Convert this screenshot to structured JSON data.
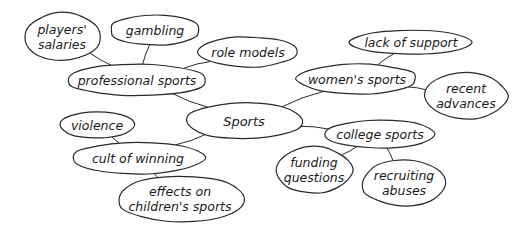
{
  "diagram": {
    "type": "mind-map",
    "center": {
      "id": "sports",
      "text": "Sports"
    },
    "nodes": [
      {
        "id": "sports",
        "lines": [
          "Sports"
        ],
        "cx": 244,
        "cy": 121,
        "rx": 58,
        "ry": 18
      },
      {
        "id": "professional",
        "lines": [
          "professional sports"
        ],
        "cx": 137,
        "cy": 80,
        "rx": 70,
        "ry": 16
      },
      {
        "id": "salaries",
        "lines": [
          "players'",
          "salaries"
        ],
        "cx": 62,
        "cy": 37,
        "rx": 38,
        "ry": 24
      },
      {
        "id": "gambling",
        "lines": [
          "gambling"
        ],
        "cx": 155,
        "cy": 30,
        "rx": 45,
        "ry": 15
      },
      {
        "id": "role-models",
        "lines": [
          "role models"
        ],
        "cx": 248,
        "cy": 52,
        "rx": 49,
        "ry": 15
      },
      {
        "id": "womens",
        "lines": [
          "women's sports"
        ],
        "cx": 357,
        "cy": 79,
        "rx": 60,
        "ry": 15
      },
      {
        "id": "lack-support",
        "lines": [
          "lack of support"
        ],
        "cx": 411,
        "cy": 42,
        "rx": 61,
        "ry": 12
      },
      {
        "id": "recent-advances",
        "lines": [
          "recent",
          "advances"
        ],
        "cx": 466,
        "cy": 96,
        "rx": 41,
        "ry": 23
      },
      {
        "id": "college",
        "lines": [
          "college sports"
        ],
        "cx": 380,
        "cy": 134,
        "rx": 55,
        "ry": 14
      },
      {
        "id": "funding",
        "lines": [
          "funding",
          "questions"
        ],
        "cx": 314,
        "cy": 170,
        "rx": 38,
        "ry": 23
      },
      {
        "id": "recruiting",
        "lines": [
          "recruiting",
          "abuses"
        ],
        "cx": 404,
        "cy": 183,
        "rx": 42,
        "ry": 23
      },
      {
        "id": "cult",
        "lines": [
          "cult of winning"
        ],
        "cx": 138,
        "cy": 158,
        "rx": 66,
        "ry": 16
      },
      {
        "id": "violence",
        "lines": [
          "violence"
        ],
        "cx": 97,
        "cy": 125,
        "rx": 38,
        "ry": 13
      },
      {
        "id": "childrens",
        "lines": [
          "effects on",
          "children's sports"
        ],
        "cx": 180,
        "cy": 199,
        "rx": 63,
        "ry": 23
      }
    ],
    "edges": [
      [
        "sports",
        "professional"
      ],
      [
        "professional",
        "salaries"
      ],
      [
        "professional",
        "gambling"
      ],
      [
        "professional",
        "role-models"
      ],
      [
        "sports",
        "womens"
      ],
      [
        "womens",
        "lack-support"
      ],
      [
        "womens",
        "recent-advances"
      ],
      [
        "sports",
        "college"
      ],
      [
        "college",
        "funding"
      ],
      [
        "college",
        "recruiting"
      ],
      [
        "sports",
        "cult"
      ],
      [
        "cult",
        "violence"
      ],
      [
        "cult",
        "childrens"
      ]
    ],
    "colors": {
      "stroke": "#2a2a2a",
      "text": "#1a1a1a",
      "background": "#ffffff"
    }
  }
}
